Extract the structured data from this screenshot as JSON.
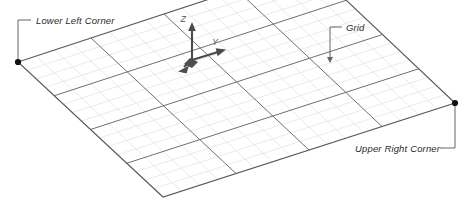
{
  "diagram": {
    "background_color": "#ffffff"
  },
  "colors": {
    "major_grid_line": "#6f6f6f",
    "minor_grid_line": "#d9d9d9",
    "outline": "#5a5a5a",
    "corner_dot": "#111111",
    "leader_line": "#555555",
    "label_text": "#2b2b2b",
    "axis_line": "#4a4a4a",
    "axis_label_text": "#555555",
    "origin_block": "#4d4d4d"
  },
  "annotations": [
    {
      "id": "lower-left-corner",
      "label": "Lower Left Corner",
      "text_x": 36,
      "text_y": 24,
      "leader": "M 18 62 L 18 20 L 31 20",
      "dot_x": 18,
      "dot_y": 62,
      "has_dot": true,
      "has_arrow": false
    },
    {
      "id": "grid",
      "label": "Grid",
      "text_x": 346,
      "text_y": 31,
      "leader": "M 330 62 L 330 27 L 342 27",
      "has_dot": false,
      "has_arrow": true,
      "arrow_x": 330,
      "arrow_y": 63
    },
    {
      "id": "upper-right-corner",
      "label": "Upper Right Corner",
      "text_x": 355,
      "text_y": 152,
      "leader": "M 455 103 L 455 148 L 440 148",
      "dot_x": 455,
      "dot_y": 103,
      "has_dot": true,
      "has_arrow": false
    }
  ],
  "axes": {
    "origin": {
      "x": 192,
      "y": 60
    },
    "items": [
      {
        "name": "Z",
        "label": "Z",
        "label_x": 186,
        "label_y": 22,
        "tip_x": 192,
        "tip_y": 24
      },
      {
        "name": "Y",
        "label": "Y",
        "label_x": 212,
        "label_y": 45,
        "tip_x": 224,
        "tip_y": 51
      },
      {
        "name": "X",
        "label": "",
        "label_x": 0,
        "label_y": 0,
        "tip_x": 180,
        "tip_y": 69
      }
    ]
  },
  "grid": {
    "major_divisions_u": 4,
    "major_divisions_v": 4,
    "minor_per_major": 4,
    "corners": {
      "left": {
        "x": 18,
        "y": 62
      },
      "top": {
        "x": 310,
        "y": -34
      },
      "right": {
        "x": 455,
        "y": 103
      },
      "bottom": {
        "x": 163,
        "y": 197
      }
    }
  }
}
